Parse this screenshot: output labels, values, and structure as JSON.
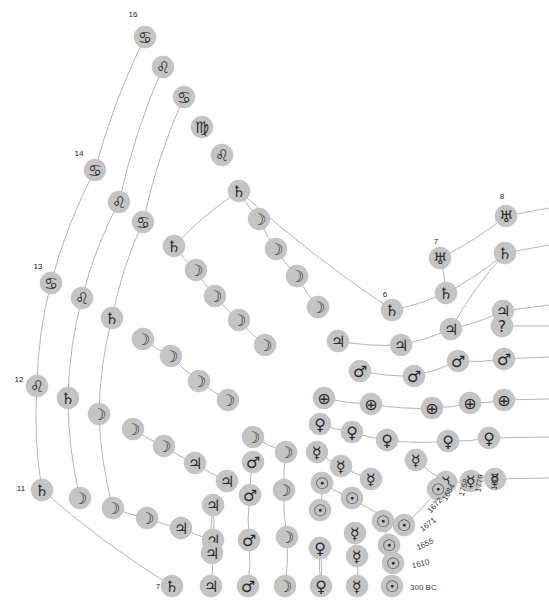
{
  "figure": {
    "background_color": "#ffffff",
    "node_fill": "#c4c4c4",
    "node_stroke": "#bdbdbd",
    "edge_color": "#b5b5b5",
    "glyph_color": "#2b2b2b"
  },
  "chart_data": {
    "type": "scatter",
    "xlabel": "",
    "ylabel": "",
    "grid": false,
    "legend": null,
    "year_axis": {
      "labels": [
        "300 BC",
        "1610",
        "1655",
        "1671",
        "1672",
        "1684",
        "1758",
        "1779",
        "1801"
      ],
      "rotated": true
    },
    "count_labels": [
      {
        "text": "16",
        "x": 133,
        "y": 14
      },
      {
        "text": "14",
        "x": 79,
        "y": 153
      },
      {
        "text": "13",
        "x": 38,
        "y": 266
      },
      {
        "text": "12",
        "x": 19,
        "y": 379
      },
      {
        "text": "11",
        "x": 21,
        "y": 488
      },
      {
        "text": "7",
        "x": 158,
        "y": 586
      },
      {
        "text": "6",
        "x": 385,
        "y": 294
      },
      {
        "text": "7",
        "x": 436,
        "y": 241
      },
      {
        "text": "8",
        "x": 502,
        "y": 196
      }
    ],
    "symbols": {
      "sun": "☉",
      "mercury": "☿",
      "venus": "♀",
      "earth": "⊕",
      "moon": "☽",
      "mars": "♂",
      "jupiter": "♃",
      "saturn": "♄",
      "uranus": "♅",
      "cancer": "♋",
      "leo": "♌",
      "virgo": "♍",
      "question": "?"
    },
    "nodes": [
      {
        "id": "n1",
        "symbol": "cancer",
        "x": 145,
        "y": 37,
        "r": 11
      },
      {
        "id": "n2",
        "symbol": "leo",
        "x": 163,
        "y": 67,
        "r": 11
      },
      {
        "id": "n3",
        "symbol": "cancer",
        "x": 184,
        "y": 97,
        "r": 11
      },
      {
        "id": "n4",
        "symbol": "virgo",
        "x": 202,
        "y": 127,
        "r": 11
      },
      {
        "id": "n5",
        "symbol": "leo",
        "x": 222,
        "y": 155,
        "r": 11
      },
      {
        "id": "n6",
        "symbol": "cancer",
        "x": 95,
        "y": 170,
        "r": 11
      },
      {
        "id": "n7",
        "symbol": "leo",
        "x": 119,
        "y": 202,
        "r": 11
      },
      {
        "id": "n8",
        "symbol": "cancer",
        "x": 143,
        "y": 222,
        "r": 11
      },
      {
        "id": "n9",
        "symbol": "saturn",
        "x": 239,
        "y": 191,
        "r": 11
      },
      {
        "id": "n10",
        "symbol": "moon",
        "x": 259,
        "y": 219,
        "r": 11
      },
      {
        "id": "n11",
        "symbol": "moon",
        "x": 276,
        "y": 249,
        "r": 11
      },
      {
        "id": "n12",
        "symbol": "moon",
        "x": 297,
        "y": 276,
        "r": 11
      },
      {
        "id": "n13",
        "symbol": "moon",
        "x": 318,
        "y": 307,
        "r": 11
      },
      {
        "id": "n14",
        "symbol": "saturn",
        "x": 174,
        "y": 246,
        "r": 11
      },
      {
        "id": "n15",
        "symbol": "moon",
        "x": 196,
        "y": 270,
        "r": 11
      },
      {
        "id": "n16",
        "symbol": "moon",
        "x": 215,
        "y": 296,
        "r": 11
      },
      {
        "id": "n17",
        "symbol": "moon",
        "x": 239,
        "y": 320,
        "r": 11
      },
      {
        "id": "n18",
        "symbol": "moon",
        "x": 265,
        "y": 345,
        "r": 11
      },
      {
        "id": "n19",
        "symbol": "cancer",
        "x": 51,
        "y": 283,
        "r": 11
      },
      {
        "id": "n20",
        "symbol": "leo",
        "x": 82,
        "y": 298,
        "r": 11
      },
      {
        "id": "n21",
        "symbol": "saturn",
        "x": 112,
        "y": 318,
        "r": 11
      },
      {
        "id": "n22",
        "symbol": "moon",
        "x": 143,
        "y": 339,
        "r": 11
      },
      {
        "id": "n23",
        "symbol": "moon",
        "x": 171,
        "y": 356,
        "r": 11
      },
      {
        "id": "n24",
        "symbol": "moon",
        "x": 199,
        "y": 381,
        "r": 11
      },
      {
        "id": "n25",
        "symbol": "moon",
        "x": 228,
        "y": 400,
        "r": 11
      },
      {
        "id": "n26",
        "symbol": "leo",
        "x": 37,
        "y": 386,
        "r": 11
      },
      {
        "id": "n27",
        "symbol": "saturn",
        "x": 68,
        "y": 398,
        "r": 11
      },
      {
        "id": "n28",
        "symbol": "moon",
        "x": 99,
        "y": 414,
        "r": 11
      },
      {
        "id": "n29",
        "symbol": "moon",
        "x": 133,
        "y": 429,
        "r": 11
      },
      {
        "id": "n30",
        "symbol": "moon",
        "x": 164,
        "y": 446,
        "r": 11
      },
      {
        "id": "n31",
        "symbol": "jupiter",
        "x": 195,
        "y": 463,
        "r": 11
      },
      {
        "id": "n32",
        "symbol": "jupiter",
        "x": 227,
        "y": 481,
        "r": 11
      },
      {
        "id": "n33",
        "symbol": "saturn",
        "x": 42,
        "y": 490,
        "r": 11
      },
      {
        "id": "n34",
        "symbol": "moon",
        "x": 80,
        "y": 498,
        "r": 11
      },
      {
        "id": "n35",
        "symbol": "moon",
        "x": 113,
        "y": 508,
        "r": 11
      },
      {
        "id": "n36",
        "symbol": "moon",
        "x": 147,
        "y": 518,
        "r": 11
      },
      {
        "id": "n37",
        "symbol": "jupiter",
        "x": 181,
        "y": 528,
        "r": 11
      },
      {
        "id": "n38",
        "symbol": "jupiter",
        "x": 213,
        "y": 540,
        "r": 11
      },
      {
        "id": "n39",
        "symbol": "saturn",
        "x": 172,
        "y": 586,
        "r": 11
      },
      {
        "id": "n40",
        "symbol": "jupiter",
        "x": 211,
        "y": 586,
        "r": 11
      },
      {
        "id": "n41",
        "symbol": "mars",
        "x": 248,
        "y": 586,
        "r": 11
      },
      {
        "id": "n42",
        "symbol": "moon",
        "x": 285,
        "y": 586,
        "r": 11
      },
      {
        "id": "n43",
        "symbol": "venus",
        "x": 321,
        "y": 586,
        "r": 11
      },
      {
        "id": "n44",
        "symbol": "mercury",
        "x": 357,
        "y": 586,
        "r": 11
      },
      {
        "id": "n45",
        "symbol": "sun",
        "x": 392,
        "y": 586,
        "r": 11
      },
      {
        "id": "n46",
        "symbol": "saturn",
        "x": 392,
        "y": 310,
        "r": 11
      },
      {
        "id": "n47",
        "symbol": "saturn",
        "x": 446,
        "y": 293,
        "r": 11
      },
      {
        "id": "n48",
        "symbol": "uranus",
        "x": 440,
        "y": 258,
        "r": 11
      },
      {
        "id": "n49",
        "symbol": "uranus",
        "x": 506,
        "y": 216,
        "r": 11
      },
      {
        "id": "n50",
        "symbol": "saturn",
        "x": 505,
        "y": 253,
        "r": 11
      },
      {
        "id": "n51",
        "symbol": "jupiter",
        "x": 338,
        "y": 341,
        "r": 11
      },
      {
        "id": "n52",
        "symbol": "jupiter",
        "x": 401,
        "y": 345,
        "r": 11
      },
      {
        "id": "n53",
        "symbol": "jupiter",
        "x": 451,
        "y": 329,
        "r": 11
      },
      {
        "id": "n54",
        "symbol": "jupiter",
        "x": 503,
        "y": 311,
        "r": 11
      },
      {
        "id": "n55",
        "symbol": "question",
        "x": 502,
        "y": 326,
        "r": 11
      },
      {
        "id": "n56",
        "symbol": "mars",
        "x": 360,
        "y": 371,
        "r": 11
      },
      {
        "id": "n57",
        "symbol": "mars",
        "x": 414,
        "y": 376,
        "r": 11
      },
      {
        "id": "n58",
        "symbol": "mars",
        "x": 458,
        "y": 361,
        "r": 11
      },
      {
        "id": "n59",
        "symbol": "mars",
        "x": 504,
        "y": 359,
        "r": 11
      },
      {
        "id": "n60",
        "symbol": "earth",
        "x": 324,
        "y": 398,
        "r": 11
      },
      {
        "id": "n61",
        "symbol": "earth",
        "x": 371,
        "y": 404,
        "r": 11
      },
      {
        "id": "n62",
        "symbol": "earth",
        "x": 432,
        "y": 408,
        "r": 11
      },
      {
        "id": "n63",
        "symbol": "earth",
        "x": 470,
        "y": 403,
        "r": 11
      },
      {
        "id": "n64",
        "symbol": "earth",
        "x": 504,
        "y": 400,
        "r": 11
      },
      {
        "id": "n65",
        "symbol": "venus",
        "x": 320,
        "y": 424,
        "r": 11
      },
      {
        "id": "n66",
        "symbol": "venus",
        "x": 352,
        "y": 432,
        "r": 11
      },
      {
        "id": "n67",
        "symbol": "venus",
        "x": 387,
        "y": 440,
        "r": 11
      },
      {
        "id": "n68",
        "symbol": "venus",
        "x": 448,
        "y": 441,
        "r": 11
      },
      {
        "id": "n69",
        "symbol": "venus",
        "x": 489,
        "y": 438,
        "r": 11
      },
      {
        "id": "n70",
        "symbol": "mercury",
        "x": 317,
        "y": 452,
        "r": 11
      },
      {
        "id": "n71",
        "symbol": "mercury",
        "x": 341,
        "y": 466,
        "r": 11
      },
      {
        "id": "n72",
        "symbol": "mercury",
        "x": 371,
        "y": 479,
        "r": 11
      },
      {
        "id": "n73",
        "symbol": "mercury",
        "x": 416,
        "y": 460,
        "r": 11
      },
      {
        "id": "n74",
        "symbol": "mercury",
        "x": 446,
        "y": 482,
        "r": 11
      },
      {
        "id": "n75",
        "symbol": "mercury",
        "x": 471,
        "y": 481,
        "r": 11
      },
      {
        "id": "n76",
        "symbol": "mercury",
        "x": 495,
        "y": 479,
        "r": 11
      },
      {
        "id": "n77",
        "symbol": "sun",
        "x": 322,
        "y": 483,
        "r": 11
      },
      {
        "id": "n78",
        "symbol": "sun",
        "x": 320,
        "y": 510,
        "r": 11
      },
      {
        "id": "n79",
        "symbol": "sun",
        "x": 352,
        "y": 498,
        "r": 11
      },
      {
        "id": "n80",
        "symbol": "sun",
        "x": 383,
        "y": 521,
        "r": 11
      },
      {
        "id": "n81",
        "symbol": "sun",
        "x": 389,
        "y": 545,
        "r": 11
      },
      {
        "id": "n82",
        "symbol": "sun",
        "x": 393,
        "y": 563,
        "r": 11
      },
      {
        "id": "n83",
        "symbol": "sun",
        "x": 404,
        "y": 525,
        "r": 11
      },
      {
        "id": "n84",
        "symbol": "sun",
        "x": 438,
        "y": 489,
        "r": 11
      },
      {
        "id": "n85",
        "symbol": "moon",
        "x": 253,
        "y": 437,
        "r": 11
      },
      {
        "id": "n86",
        "symbol": "moon",
        "x": 286,
        "y": 452,
        "r": 11
      },
      {
        "id": "n87",
        "symbol": "moon",
        "x": 284,
        "y": 490,
        "r": 11
      },
      {
        "id": "n88",
        "symbol": "moon",
        "x": 287,
        "y": 537,
        "r": 11
      },
      {
        "id": "n89",
        "symbol": "mars",
        "x": 253,
        "y": 462,
        "r": 11
      },
      {
        "id": "n90",
        "symbol": "mars",
        "x": 250,
        "y": 495,
        "r": 11
      },
      {
        "id": "n91",
        "symbol": "mars",
        "x": 249,
        "y": 540,
        "r": 11
      },
      {
        "id": "n92",
        "symbol": "jupiter",
        "x": 213,
        "y": 505,
        "r": 11
      },
      {
        "id": "n93",
        "symbol": "jupiter",
        "x": 212,
        "y": 553,
        "r": 11
      },
      {
        "id": "n94",
        "symbol": "venus",
        "x": 320,
        "y": 548,
        "r": 11
      },
      {
        "id": "n95",
        "symbol": "mercury",
        "x": 355,
        "y": 533,
        "r": 11
      },
      {
        "id": "n96",
        "symbol": "mercury",
        "x": 357,
        "y": 556,
        "r": 11
      }
    ],
    "edges": [
      {
        "from": "n1",
        "to": "n6"
      },
      {
        "from": "n2",
        "to": "n7"
      },
      {
        "from": "n3",
        "to": "n8"
      },
      {
        "from": "n6",
        "to": "n19"
      },
      {
        "from": "n7",
        "to": "n20"
      },
      {
        "from": "n8",
        "to": "n21"
      },
      {
        "from": "n19",
        "to": "n26"
      },
      {
        "from": "n20",
        "to": "n27"
      },
      {
        "from": "n21",
        "to": "n28"
      },
      {
        "from": "n26",
        "to": "n33"
      },
      {
        "from": "n27",
        "to": "n34"
      },
      {
        "from": "n28",
        "to": "n35"
      },
      {
        "from": "n9",
        "to": "n10"
      },
      {
        "from": "n9",
        "to": "n14"
      },
      {
        "from": "n10",
        "to": "n11"
      },
      {
        "from": "n11",
        "to": "n12"
      },
      {
        "from": "n12",
        "to": "n13"
      },
      {
        "from": "n14",
        "to": "n15"
      },
      {
        "from": "n15",
        "to": "n16"
      },
      {
        "from": "n16",
        "to": "n17"
      },
      {
        "from": "n17",
        "to": "n18"
      },
      {
        "from": "n22",
        "to": "n23"
      },
      {
        "from": "n23",
        "to": "n24"
      },
      {
        "from": "n24",
        "to": "n25"
      },
      {
        "from": "n29",
        "to": "n30"
      },
      {
        "from": "n30",
        "to": "n31"
      },
      {
        "from": "n31",
        "to": "n32"
      },
      {
        "from": "n33",
        "to": "n39"
      },
      {
        "from": "n35",
        "to": "n36"
      },
      {
        "from": "n36",
        "to": "n37"
      },
      {
        "from": "n37",
        "to": "n38"
      },
      {
        "from": "n9",
        "to": "n46"
      },
      {
        "from": "n46",
        "to": "n47"
      },
      {
        "from": "n47",
        "to": "n48"
      },
      {
        "from": "n48",
        "to": "n49"
      },
      {
        "from": "n47",
        "to": "n50"
      },
      {
        "from": "n50",
        "to": "n53"
      },
      {
        "from": "n51",
        "to": "n52"
      },
      {
        "from": "n52",
        "to": "n53"
      },
      {
        "from": "n53",
        "to": "n54"
      },
      {
        "from": "n56",
        "to": "n57"
      },
      {
        "from": "n57",
        "to": "n58"
      },
      {
        "from": "n58",
        "to": "n59"
      },
      {
        "from": "n60",
        "to": "n61"
      },
      {
        "from": "n61",
        "to": "n62"
      },
      {
        "from": "n62",
        "to": "n63"
      },
      {
        "from": "n63",
        "to": "n64"
      },
      {
        "from": "n65",
        "to": "n66"
      },
      {
        "from": "n66",
        "to": "n67"
      },
      {
        "from": "n67",
        "to": "n68"
      },
      {
        "from": "n68",
        "to": "n69"
      },
      {
        "from": "n70",
        "to": "n71"
      },
      {
        "from": "n71",
        "to": "n72"
      },
      {
        "from": "n73",
        "to": "n74"
      },
      {
        "from": "n74",
        "to": "n75"
      },
      {
        "from": "n75",
        "to": "n76"
      },
      {
        "from": "n77",
        "to": "n79"
      },
      {
        "from": "n79",
        "to": "n83"
      },
      {
        "from": "n83",
        "to": "n84"
      },
      {
        "from": "n78",
        "to": "n77"
      },
      {
        "from": "n80",
        "to": "n81"
      },
      {
        "from": "n81",
        "to": "n82"
      },
      {
        "from": "n40",
        "to": "n93"
      },
      {
        "from": "n41",
        "to": "n91"
      },
      {
        "from": "n42",
        "to": "n88"
      },
      {
        "from": "n43",
        "to": "n94"
      },
      {
        "from": "n44",
        "to": "n96"
      },
      {
        "from": "n92",
        "to": "n93"
      },
      {
        "from": "n89",
        "to": "n90"
      },
      {
        "from": "n90",
        "to": "n91"
      },
      {
        "from": "n85",
        "to": "n86"
      },
      {
        "from": "n86",
        "to": "n87"
      },
      {
        "from": "n87",
        "to": "n88"
      },
      {
        "from": "n95",
        "to": "n96"
      },
      {
        "from": "n94",
        "to": "n43"
      },
      {
        "from": "n38",
        "to": "n92"
      }
    ],
    "edges_to_right_margin": [
      {
        "from": "n49",
        "y": 208
      },
      {
        "from": "n50",
        "y": 245
      },
      {
        "from": "n54",
        "y": 305
      },
      {
        "from": "n55",
        "y": 326
      },
      {
        "from": "n59",
        "y": 357
      },
      {
        "from": "n64",
        "y": 399
      },
      {
        "from": "n69",
        "y": 437
      },
      {
        "from": "n76",
        "y": 478
      }
    ],
    "years_rotated": [
      {
        "text": "300 BC",
        "x": 410,
        "y": 587,
        "rotate": 0
      },
      {
        "text": "1610",
        "x": 412,
        "y": 566,
        "rotate": -14
      },
      {
        "text": "1655",
        "x": 417,
        "y": 548,
        "rotate": -25
      },
      {
        "text": "1671",
        "x": 421,
        "y": 530,
        "rotate": -38
      },
      {
        "text": "1672",
        "x": 429,
        "y": 512,
        "rotate": -48
      },
      {
        "text": "1684",
        "x": 444,
        "y": 500,
        "rotate": -60
      },
      {
        "text": "1758",
        "x": 461,
        "y": 496,
        "rotate": -72
      },
      {
        "text": "1779",
        "x": 478,
        "y": 492,
        "rotate": -80
      },
      {
        "text": "1801",
        "x": 494,
        "y": 490,
        "rotate": -85
      }
    ]
  }
}
